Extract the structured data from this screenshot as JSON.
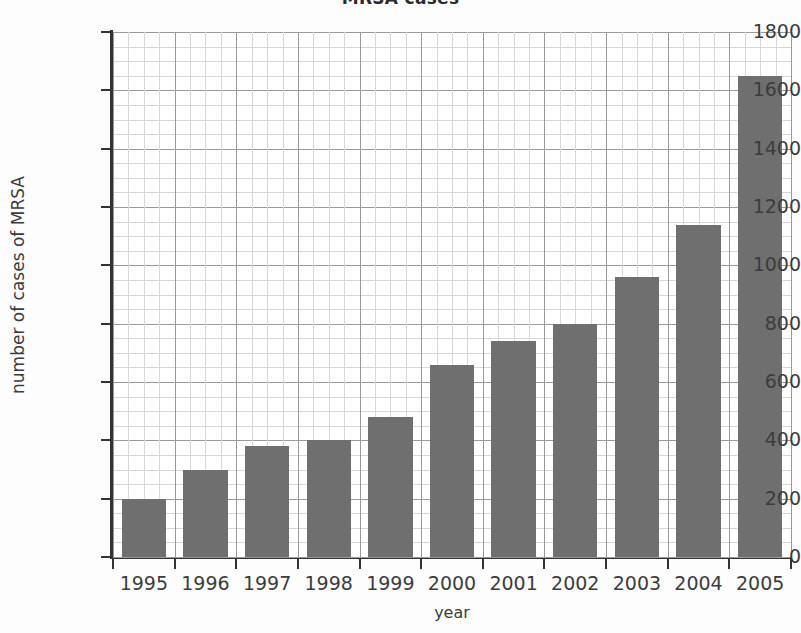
{
  "chart_data": {
    "type": "bar",
    "title": "MRSA cases",
    "xlabel": "year",
    "ylabel": "number of cases of MRSA",
    "categories": [
      "1995",
      "1996",
      "1997",
      "1998",
      "1999",
      "2000",
      "2001",
      "2002",
      "2003",
      "2004",
      "2005"
    ],
    "values": [
      200,
      300,
      380,
      400,
      480,
      660,
      740,
      800,
      960,
      1140,
      1650
    ],
    "ylim": [
      0,
      1800
    ],
    "yticks": [
      0,
      200,
      400,
      600,
      800,
      1000,
      1200,
      1400,
      1600,
      1800
    ],
    "ytick_labels": [
      "0",
      "200",
      "400",
      "600",
      "800",
      "1000",
      "1200",
      "1400",
      "1600",
      "1800"
    ],
    "grid": true,
    "minor_grid": true,
    "legend": null,
    "bar_color": "#6f6f6f",
    "background_color": "#ffffff",
    "axis_color": "#333333",
    "grid_color": "#9a9a9a",
    "minor_grid_color": "#d8d8d8"
  }
}
